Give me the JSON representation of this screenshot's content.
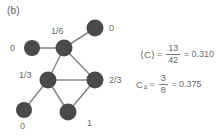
{
  "figure": {
    "panel_label": "(b)",
    "node_color": "#4a4a4a",
    "edge_color": "#8a8a8a",
    "text_color": "#6a6a6a",
    "background": "#ffffff"
  },
  "graph": {
    "type": "network-graph",
    "nodes": [
      {
        "id": "n-left-top",
        "label": "0",
        "cx": 32,
        "cy": 48,
        "r": 8,
        "label_x": 10,
        "label_y": 44
      },
      {
        "id": "n-hub",
        "label": "1/6",
        "cx": 64,
        "cy": 48,
        "r": 8.5,
        "label_x": 51,
        "label_y": 27
      },
      {
        "id": "n-top-right",
        "label": "0",
        "cx": 95,
        "cy": 28,
        "r": 8.5,
        "label_x": 109,
        "label_y": 24
      },
      {
        "id": "n-mid-left",
        "label": "1/3",
        "cx": 48,
        "cy": 80,
        "r": 8.5,
        "label_x": 19,
        "label_y": 71
      },
      {
        "id": "n-mid-right",
        "label": "2/3",
        "cx": 95,
        "cy": 80,
        "r": 8.5,
        "label_x": 109,
        "label_y": 76
      },
      {
        "id": "n-bottom-left",
        "label": "0",
        "cx": 24,
        "cy": 110,
        "r": 8,
        "label_x": 20,
        "label_y": 122
      },
      {
        "id": "n-bottom-mid",
        "label": "1",
        "cx": 68,
        "cy": 112,
        "r": 8.5,
        "label_x": 87,
        "label_y": 119
      }
    ],
    "edges": [
      {
        "from": "n-left-top",
        "to": "n-hub"
      },
      {
        "from": "n-hub",
        "to": "n-top-right"
      },
      {
        "from": "n-hub",
        "to": "n-mid-left"
      },
      {
        "from": "n-hub",
        "to": "n-mid-right"
      },
      {
        "from": "n-mid-left",
        "to": "n-mid-right"
      },
      {
        "from": "n-mid-left",
        "to": "n-bottom-left"
      },
      {
        "from": "n-mid-left",
        "to": "n-bottom-mid"
      },
      {
        "from": "n-mid-right",
        "to": "n-bottom-mid"
      }
    ]
  },
  "equations": {
    "mean": {
      "symbol": "⟨C⟩",
      "equals": "=",
      "numerator": "13",
      "denominator": "42",
      "equals2": "=",
      "result": "0.310"
    },
    "global": {
      "symbol": "C",
      "subscript": "Δ",
      "equals": "=",
      "numerator": "3",
      "denominator": "8",
      "equals2": "=",
      "result": "0.375"
    }
  }
}
